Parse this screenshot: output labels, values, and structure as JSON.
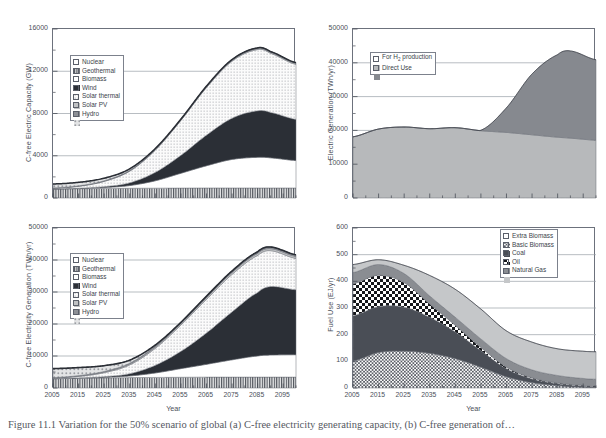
{
  "figure": {
    "caption": "Figure 11.1 Variation for the 50% scenario of global (a) C-free electricity generating capacity, (b) C-free generation of…"
  },
  "xaxis": {
    "label": "Year",
    "ticks": [
      "2005",
      "2015",
      "2025",
      "2035",
      "2045",
      "2055",
      "2065",
      "2075",
      "2085",
      "2095"
    ],
    "min": 2005,
    "max": 2100
  },
  "panels": [
    {
      "id": "(a)",
      "key": "a",
      "ylabel": "C-free Electric Capacity (GW)",
      "yticks": [
        "0",
        "4000",
        "8000",
        "12000",
        "16000"
      ]
    },
    {
      "id": "(b)",
      "key": "b",
      "ylabel": "C-free Electricity Generation (TWh/yr)",
      "yticks": [
        "0",
        "10000",
        "20000",
        "30000",
        "40000",
        "50000"
      ]
    },
    {
      "id": "(c)",
      "key": "c",
      "ylabel": "Electric Generation (TWh/yr)",
      "yticks": [
        "0",
        "10000",
        "20000",
        "30000",
        "40000",
        "50000"
      ]
    },
    {
      "id": "(d)",
      "key": "d",
      "ylabel": "Fuel Use (EJ/yr)",
      "yticks": [
        "0",
        "100",
        "200",
        "300",
        "400",
        "500",
        "600"
      ]
    }
  ],
  "legends": {
    "a": [
      {
        "label": "Nuclear",
        "fill": "vstripe",
        "color": "#8a8f98"
      },
      {
        "label": "Geothermal",
        "fill": "solid",
        "color": "#ffffff"
      },
      {
        "label": "Biomass",
        "fill": "solid",
        "color": "#2b2f36"
      },
      {
        "label": "Wind",
        "fill": "dots",
        "color": "#f2f2f2"
      },
      {
        "label": "Solar thermal",
        "fill": "solid",
        "color": "#c0c2c4"
      },
      {
        "label": "Solar PV",
        "fill": "solid",
        "color": "#8d9096"
      },
      {
        "label": "Hydro",
        "fill": "coarse",
        "color": "#d8d9da"
      }
    ],
    "b": [
      {
        "label": "Nuclear",
        "fill": "vstripe",
        "color": "#8a8f98"
      },
      {
        "label": "Geothermal",
        "fill": "solid",
        "color": "#ffffff"
      },
      {
        "label": "Biomass",
        "fill": "solid",
        "color": "#2b2f36"
      },
      {
        "label": "Wind",
        "fill": "dots",
        "color": "#f2f2f2"
      },
      {
        "label": "Solar thermal",
        "fill": "solid",
        "color": "#c0c2c4"
      },
      {
        "label": "Solar PV",
        "fill": "solid",
        "color": "#8d9096"
      },
      {
        "label": "Hydro",
        "fill": "coarse",
        "color": "#d8d9da"
      }
    ],
    "c": [
      {
        "label": "For H2 production",
        "html": "For H<sub>2</sub> production",
        "fill": "solid",
        "color": "#b7b9bb"
      },
      {
        "label": "Direct Use",
        "html": "Direct Use",
        "fill": "solid",
        "color": "#86898f"
      }
    ],
    "d": [
      {
        "label": "Extra Biomass",
        "fill": "fgrid",
        "color": "#fafafa"
      },
      {
        "label": "Basic Biomass",
        "fill": "solid",
        "color": "#4a4e56"
      },
      {
        "label": "Coal",
        "fill": "cgrid",
        "color": "#ffffff"
      },
      {
        "label": "Oil",
        "fill": "solid",
        "color": "#8a8d92"
      },
      {
        "label": "Natural Gas",
        "fill": "solid",
        "color": "#c5c7c9"
      }
    ]
  },
  "chart_data": [
    {
      "panel": "(a)",
      "type": "area",
      "stacked": true,
      "title": "C-free electricity generating capacity",
      "xlabel": "Year",
      "ylabel": "C-free Electric Capacity (GW)",
      "xlim": [
        2005,
        2100
      ],
      "ylim": [
        0,
        16000
      ],
      "ytick_step": 4000,
      "grid": "horizontal",
      "x": [
        2005,
        2015,
        2025,
        2035,
        2045,
        2055,
        2065,
        2075,
        2085,
        2090,
        2100
      ],
      "series": [
        {
          "name": "Hydro",
          "values": [
            850,
            880,
            900,
            920,
            930,
            940,
            950,
            950,
            950,
            950,
            950
          ]
        },
        {
          "name": "Solar PV",
          "values": [
            10,
            30,
            90,
            260,
            700,
            1400,
            2100,
            2700,
            2900,
            2850,
            2600
          ]
        },
        {
          "name": "Solar thermal",
          "values": [
            5,
            20,
            80,
            260,
            800,
            1700,
            2900,
            3900,
            4400,
            4300,
            3900
          ]
        },
        {
          "name": "Wind",
          "values": [
            60,
            180,
            500,
            1100,
            2100,
            3300,
            4500,
            5400,
            5800,
            5600,
            5200
          ]
        },
        {
          "name": "Biomass",
          "values": [
            20,
            30,
            40,
            50,
            60,
            70,
            80,
            90,
            95,
            95,
            95
          ]
        },
        {
          "name": "Geothermal",
          "values": [
            10,
            15,
            25,
            35,
            45,
            55,
            60,
            65,
            70,
            70,
            70
          ]
        },
        {
          "name": "Nuclear",
          "values": [
            370,
            330,
            240,
            140,
            50,
            0,
            0,
            0,
            0,
            0,
            0
          ]
        }
      ],
      "total": [
        1325,
        1485,
        1875,
        2765,
        4685,
        7465,
        10590,
        13105,
        14215,
        13865,
        12815
      ],
      "peak": {
        "x": 2087,
        "y": 14200
      }
    },
    {
      "panel": "(b)",
      "type": "area",
      "stacked": true,
      "title": "C-free electricity generation",
      "xlabel": "Year",
      "ylabel": "C-free Electricity Generation (TWh/yr)",
      "xlim": [
        2005,
        2100
      ],
      "ylim": [
        0,
        50000
      ],
      "ytick_step": 10000,
      "grid": "horizontal",
      "x": [
        2005,
        2015,
        2025,
        2035,
        2045,
        2055,
        2065,
        2075,
        2085,
        2090,
        2100
      ],
      "series": [
        {
          "name": "Hydro",
          "values": [
            2900,
            3050,
            3150,
            3250,
            3300,
            3350,
            3400,
            3400,
            3400,
            3400,
            3400
          ]
        },
        {
          "name": "Solar PV",
          "values": [
            20,
            60,
            180,
            520,
            1400,
            2700,
            4000,
            5400,
            6600,
            6900,
            7000
          ]
        },
        {
          "name": "Solar thermal",
          "values": [
            10,
            50,
            200,
            700,
            2400,
            5400,
            9800,
            15000,
            19800,
            21400,
            20300
          ]
        },
        {
          "name": "Wind",
          "values": [
            150,
            450,
            1250,
            2750,
            5300,
            8200,
            10500,
            11700,
            11600,
            11200,
            9800
          ]
        },
        {
          "name": "Biomass",
          "values": [
            120,
            180,
            250,
            320,
            400,
            470,
            530,
            580,
            620,
            620,
            620
          ]
        },
        {
          "name": "Geothermal",
          "values": [
            60,
            90,
            150,
            230,
            320,
            400,
            450,
            500,
            530,
            530,
            530
          ]
        },
        {
          "name": "Nuclear",
          "values": [
            2800,
            2500,
            1800,
            950,
            300,
            0,
            0,
            0,
            0,
            0,
            0
          ]
        }
      ],
      "total": [
        6060,
        6380,
        6980,
        8720,
        13420,
        20520,
        35680,
        36580,
        42550,
        44050,
        41650
      ],
      "peak": {
        "x": 2089,
        "y": 43200
      }
    },
    {
      "panel": "(c)",
      "type": "area",
      "stacked": true,
      "title": "Electric generation by end use",
      "xlabel": "Year",
      "ylabel": "Electric Generation (TWh/yr)",
      "xlim": [
        2005,
        2100
      ],
      "ylim": [
        0,
        50000
      ],
      "ytick_step": 10000,
      "grid": "horizontal",
      "x": [
        2005,
        2015,
        2025,
        2035,
        2045,
        2055,
        2065,
        2075,
        2085,
        2090,
        2100
      ],
      "series": [
        {
          "name": "Direct Use",
          "values": [
            18100,
            20400,
            21000,
            20500,
            20800,
            19900,
            19400,
            18700,
            18000,
            17700,
            17100
          ]
        },
        {
          "name": "For H2 production",
          "values": [
            0,
            0,
            0,
            0,
            0,
            150,
            7300,
            18000,
            24400,
            25800,
            23800
          ]
        }
      ],
      "total": [
        18100,
        20400,
        21000,
        20500,
        20800,
        20050,
        26700,
        36700,
        42400,
        43500,
        40900
      ],
      "peak": {
        "x": 2088,
        "y": 43600
      }
    },
    {
      "panel": "(d)",
      "type": "area",
      "stacked": true,
      "title": "Fossil and biomass fuel use",
      "xlabel": "Year",
      "ylabel": "Fuel Use (EJ/yr)",
      "xlim": [
        2005,
        2100
      ],
      "ylim": [
        0,
        600
      ],
      "ytick_step": 100,
      "grid": "horizontal",
      "x": [
        2005,
        2015,
        2025,
        2035,
        2045,
        2055,
        2065,
        2075,
        2085,
        2095,
        2100
      ],
      "series": [
        {
          "name": "Natural Gas",
          "values": [
            101,
            133,
            138,
            130,
            110,
            78,
            42,
            20,
            9,
            3,
            2
          ]
        },
        {
          "name": "Oil",
          "values": [
            170,
            172,
            165,
            135,
            100,
            62,
            30,
            14,
            7,
            4,
            3
          ]
        },
        {
          "name": "Coal",
          "values": [
            120,
            118,
            92,
            50,
            25,
            12,
            6,
            4,
            3,
            3,
            3
          ]
        },
        {
          "name": "Basic Biomass",
          "values": [
            42,
            40,
            34,
            30,
            30,
            32,
            32,
            30,
            28,
            26,
            25
          ]
        },
        {
          "name": "Extra Biomass",
          "values": [
            30,
            18,
            31,
            77,
            105,
            112,
            104,
            104,
            100,
            102,
            103
          ]
        }
      ],
      "total": [
        463,
        481,
        460,
        422,
        370,
        296,
        214,
        172,
        147,
        138,
        136
      ],
      "peak": {
        "x": 2012,
        "y": 483
      }
    }
  ]
}
